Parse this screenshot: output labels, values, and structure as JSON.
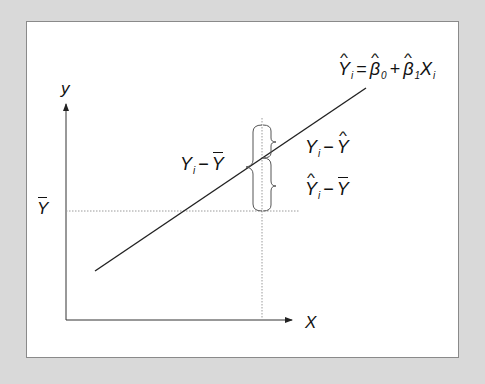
{
  "diagram": {
    "axes": {
      "x_label": "X",
      "y_label": "y",
      "y_mean_label": "Y",
      "y_mean_label_decoration": "bar"
    },
    "regression_equation": {
      "lhs": "Y",
      "lhs_subscript": "i",
      "equals": "=",
      "beta0": "β",
      "beta0_subscript": "0",
      "plus": "+",
      "beta1": "β",
      "beta1_subscript": "1",
      "x": "X",
      "x_subscript": "i",
      "text": "Ŷi = β̂0 + β̂1Xi"
    },
    "annotations": {
      "total_deviation": {
        "a": "Y",
        "a_sub": "i",
        "minus": "−",
        "b": "Y",
        "text": "Yi − Ȳ"
      },
      "residual": {
        "a": "Y",
        "a_sub": "i",
        "minus": "−",
        "b": "Y",
        "text": "Yi − Ŷ"
      },
      "explained": {
        "a": "Y",
        "a_sub": "i",
        "minus": "−",
        "b": "Y",
        "text": "Ŷi − Ȳ"
      }
    },
    "colors": {
      "background": "#d9d9d9",
      "panel": "#ffffff",
      "line": "#222222",
      "guide": "#9a9a9a"
    }
  }
}
